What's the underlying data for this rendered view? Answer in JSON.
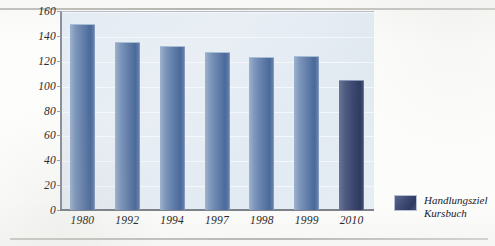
{
  "chart_data": {
    "type": "bar",
    "title": "",
    "xlabel": "",
    "ylabel": "",
    "categories": [
      "1980",
      "1992",
      "1994",
      "1997",
      "1998",
      "1999",
      "2010"
    ],
    "values": [
      149,
      134,
      131,
      126,
      122,
      123,
      104
    ],
    "ylim": [
      0,
      160
    ],
    "yticks": [
      0,
      20,
      40,
      60,
      80,
      100,
      120,
      140,
      160
    ],
    "grid": true,
    "legend_position": "right",
    "series": [
      {
        "name": "Handlungsziel Kursbuch",
        "values": [
          149,
          134,
          131,
          126,
          122,
          123,
          104
        ]
      }
    ],
    "highlighted_category": "2010",
    "colors": {
      "bar": "#5e7aa6",
      "bar_highlight": "#39456d",
      "plot_background": "#e5ecf3",
      "axis": "#7d828b",
      "gridline": "#f4f8fb",
      "text": "#2a2a2a"
    }
  },
  "legend": {
    "entries": [
      {
        "swatch_color": "#39456d",
        "label_line1": "Handlungsziel",
        "label_line2": "Kursbuch"
      }
    ]
  }
}
